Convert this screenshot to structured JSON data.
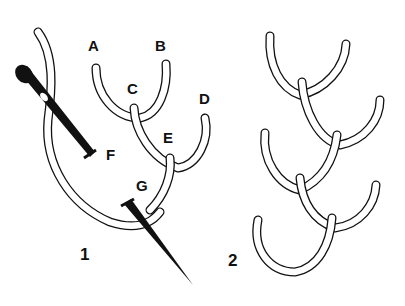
{
  "figure1": {
    "number": "1",
    "points": [
      {
        "label": "A",
        "x": 88,
        "y": 38
      },
      {
        "label": "B",
        "x": 155,
        "y": 38
      },
      {
        "label": "C",
        "x": 127,
        "y": 81
      },
      {
        "label": "D",
        "x": 199,
        "y": 91
      },
      {
        "label": "E",
        "x": 163,
        "y": 130
      },
      {
        "label": "F",
        "x": 106,
        "y": 147
      },
      {
        "label": "G",
        "x": 136,
        "y": 178
      }
    ],
    "number_pos": {
      "x": 80,
      "y": 246
    }
  },
  "figure2": {
    "number": "2",
    "number_pos": {
      "x": 228,
      "y": 252
    }
  },
  "colors": {
    "ink": "#111111",
    "thread_fill": "#ffffff",
    "background": "#ffffff"
  }
}
